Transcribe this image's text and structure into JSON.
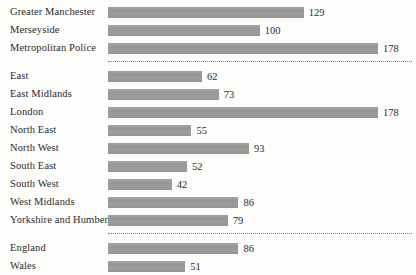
{
  "chart_data": {
    "type": "bar",
    "orientation": "horizontal",
    "title": "",
    "subtitle": "",
    "xlabel": "",
    "ylabel": "",
    "grid": false,
    "legend": null,
    "axis_visible": false,
    "value_labels": true,
    "xlim": [
      0,
      178
    ],
    "bar_color": "#9a9a9a",
    "text_color": "#2b2b2b",
    "background_color": "#fdfdfc",
    "separator_style": "dotted",
    "categories": [
      "Greater Manchester",
      "Merseyside",
      "Metropolitan Police",
      "East",
      "East Midlands",
      "London",
      "North East",
      "North West",
      "South East",
      "South West",
      "West Midlands",
      "Yorkshire and Humber",
      "England",
      "Wales"
    ],
    "values": [
      129,
      100,
      178,
      62,
      73,
      178,
      55,
      93,
      52,
      42,
      86,
      79,
      86,
      51
    ],
    "groups": [
      {
        "name": "",
        "rows": [
          {
            "label": "Greater Manchester",
            "value": 129
          },
          {
            "label": "Merseyside",
            "value": 100
          },
          {
            "label": "Metropolitan Police",
            "value": 178
          }
        ]
      },
      {
        "name": "",
        "rows": [
          {
            "label": "East",
            "value": 62
          },
          {
            "label": "East Midlands",
            "value": 73
          },
          {
            "label": "London",
            "value": 178
          },
          {
            "label": "North East",
            "value": 55
          },
          {
            "label": "North West",
            "value": 93
          },
          {
            "label": "South East",
            "value": 52
          },
          {
            "label": "South West",
            "value": 42
          },
          {
            "label": "West Midlands",
            "value": 86
          },
          {
            "label": "Yorkshire and Humber",
            "value": 79
          }
        ]
      },
      {
        "name": "",
        "rows": [
          {
            "label": "England",
            "value": 86
          },
          {
            "label": "Wales",
            "value": 51
          }
        ]
      }
    ]
  }
}
